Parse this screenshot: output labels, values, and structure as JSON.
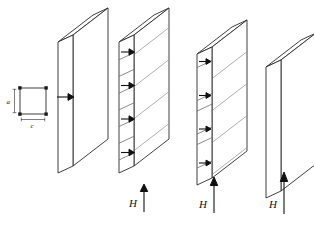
{
  "figure": {
    "type": "diagram",
    "background_color": "#ffffff",
    "line_color": "#2b2b2b",
    "hatch_color": "#9a9a9a",
    "arrow_color": "#111111"
  },
  "axes_legend": {
    "name": "crystal-axes-legend",
    "shape": "square",
    "vertical_label": "a",
    "horizontal_label": "c",
    "corner_marker_count": 4
  },
  "panels": [
    {
      "id": "panel-1",
      "name": "slab-single-domain",
      "field_label": "",
      "field_arrow_length": 0,
      "domain_arrow_count": 1,
      "stripe_count": 1,
      "has_hatching": false,
      "description": "Single domain slab with one magnetization arrow pointing right"
    },
    {
      "id": "panel-2",
      "name": "slab-fine-stripe-domains",
      "field_label": "H",
      "field_arrow_length": 22,
      "domain_arrow_count": 4,
      "stripe_count": 8,
      "has_hatching": true,
      "description": "Fine closure stripe domains, four arrows pointing right"
    },
    {
      "id": "panel-3",
      "name": "slab-coarse-stripe-domains",
      "field_label": "H",
      "field_arrow_length": 36,
      "domain_arrow_count": 4,
      "stripe_count": 8,
      "has_hatching": true,
      "description": "Coarser stripe domains with narrow reversed bands, four arrows pointing right"
    },
    {
      "id": "panel-4",
      "name": "slab-saturated",
      "field_label": "H",
      "field_arrow_length": 48,
      "domain_arrow_count": 0,
      "stripe_count": 1,
      "has_hatching": false,
      "description": "Saturated slab, domains removed, no internal arrows"
    }
  ],
  "field_labels": {
    "panel2": "H",
    "panel3": "H",
    "panel4": "H"
  }
}
